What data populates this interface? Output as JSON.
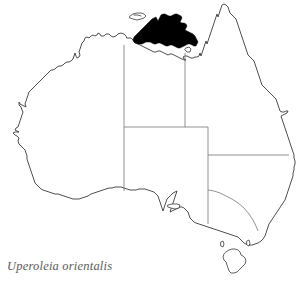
{
  "figure": {
    "kind": "species-distribution-map",
    "region_name": "Australia",
    "background_color": "#ffffff"
  },
  "caption": {
    "species_name": "Uperoleia orientalis",
    "style": "italic",
    "color": "#5b5b5b"
  },
  "legend": {
    "range_fill_color": "#000000",
    "coastline_color": "#3b3b3b",
    "state_border_color": "#6f6f6f",
    "range_description": "Top End of the Northern Territory, Arnhem Land and adjacent Gulf of Carpentaria coast"
  },
  "map": {
    "title": "",
    "mainland_label": "Australia",
    "features": [
      {
        "name": "mainland-australia",
        "type": "coastline"
      },
      {
        "name": "tasmania",
        "type": "island"
      },
      {
        "name": "melville-bathurst-islands",
        "type": "island"
      },
      {
        "name": "kangaroo-island",
        "type": "island"
      },
      {
        "name": "groote-eylandt",
        "type": "island"
      },
      {
        "name": "king-island",
        "type": "island"
      },
      {
        "name": "flinders-island",
        "type": "island"
      }
    ],
    "state_borders": [
      {
        "name": "wa-nt-sa-western-meridian"
      },
      {
        "name": "nt-qld-eastern-meridian"
      },
      {
        "name": "nt-sa-parallel"
      },
      {
        "name": "sa-nsw-vic-eastern-meridian"
      },
      {
        "name": "sa-qld-nsw-parallel"
      },
      {
        "name": "nsw-vic-murray-line"
      }
    ],
    "shaded_range": [
      {
        "name": "top-end-range-main"
      },
      {
        "name": "groote-eylandt-range-patch"
      }
    ]
  }
}
